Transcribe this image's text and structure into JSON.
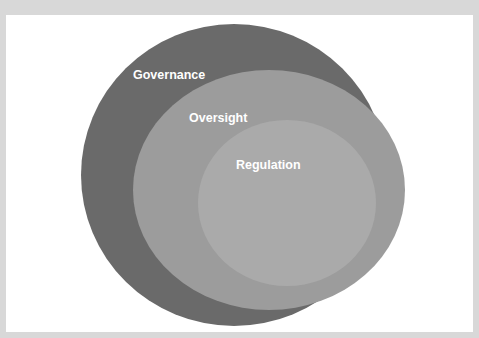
{
  "diagram": {
    "type": "nested-ellipses",
    "background_color": "#d8d8d8",
    "panel_color": "#ffffff",
    "layers": [
      {
        "label": "Governance",
        "fill": "#6a6a6a",
        "level": "outer"
      },
      {
        "label": "Oversight",
        "fill": "#9c9c9c",
        "level": "middle"
      },
      {
        "label": "Regulation",
        "fill": "#aaaaaa",
        "level": "inner"
      }
    ]
  }
}
